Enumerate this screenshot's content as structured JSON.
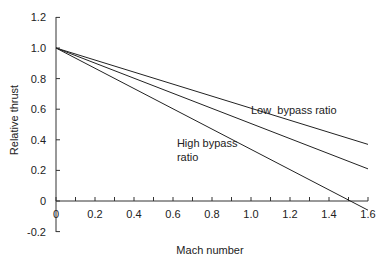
{
  "chart_data": {
    "type": "line",
    "title": "",
    "xlabel": "Mach number",
    "ylabel": "Relative thrust",
    "xlim": [
      0,
      1.6
    ],
    "ylim": [
      -0.2,
      1.2
    ],
    "x_ticks": [
      "0",
      "0.2",
      "0.4",
      "0.6",
      "0.8",
      "1.0",
      "1.2",
      "1.4",
      "1.6"
    ],
    "y_ticks": [
      "1.2",
      "1.0",
      "0.8",
      "0.6",
      "0.4",
      "0.2",
      "0",
      "-0.2"
    ],
    "grid": false,
    "series": [
      {
        "name": "Low bypass ratio",
        "x": [
          0,
          1.6
        ],
        "y": [
          1.0,
          0.37
        ]
      },
      {
        "name": "Intermediate",
        "x": [
          0,
          1.6
        ],
        "y": [
          1.0,
          0.21
        ]
      },
      {
        "name": "High bypass ratio",
        "x": [
          0,
          1.6
        ],
        "y": [
          1.0,
          -0.06
        ]
      }
    ],
    "annotations": [
      {
        "text": "Low  bypass ratio",
        "x": 1.0,
        "y": 0.57
      },
      {
        "text": "High bypass",
        "x": 0.62,
        "y": 0.35
      },
      {
        "text": "ratio",
        "x": 0.62,
        "y": 0.26
      }
    ]
  }
}
